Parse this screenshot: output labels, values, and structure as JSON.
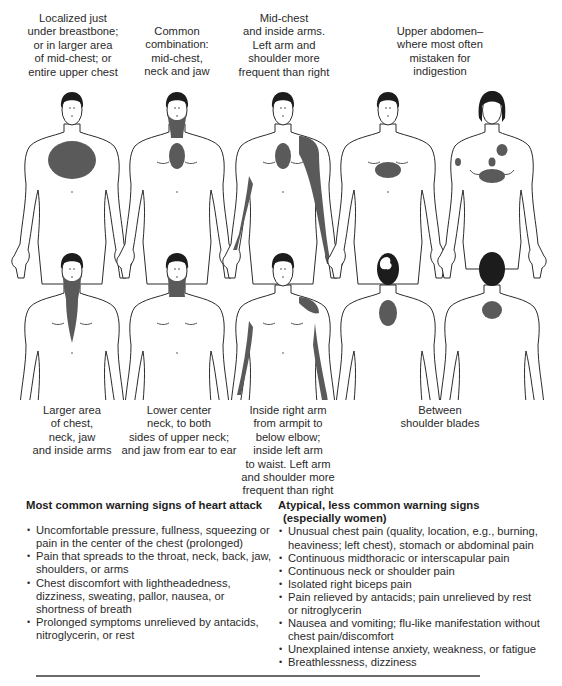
{
  "figure": {
    "top_row": [
      {
        "id": "fig1",
        "caption": "Localized just\nunder breastbone;\nor in larger area\nof mid-chest; or\nentire upper chest",
        "view": "front",
        "sex": "male",
        "cx": 72,
        "areas": [
          "upper-chest-large"
        ]
      },
      {
        "id": "fig2",
        "caption": "Common\ncombination:\nmid-chest,\nneck and jaw",
        "view": "front",
        "sex": "male",
        "cx": 177,
        "areas": [
          "jaw-neck",
          "mid-chest"
        ]
      },
      {
        "id": "fig3",
        "caption": "Mid-chest\nand inside arms.\nLeft arm and\nshoulder more\nfrequent than right",
        "view": "front",
        "sex": "male",
        "cx": 283,
        "areas": [
          "mid-chest",
          "left-shoulder-arm",
          "right-inner-arm"
        ]
      },
      {
        "id": "fig4",
        "caption": "Upper abdomen–\nwhere most often\nmistaken for\nindigestion",
        "view": "front",
        "sex": "male",
        "cx": 388,
        "areas": [
          "upper-abdomen"
        ]
      },
      {
        "id": "fig5",
        "caption": "",
        "view": "front",
        "sex": "female",
        "cx": 492,
        "areas": [
          "upper-abdomen",
          "left-chest-spot",
          "mid-spot",
          "right-arm-spot"
        ]
      }
    ],
    "bottom_row": [
      {
        "id": "fig6",
        "caption": "Larger area\nof chest,\nneck, jaw\nand inside arms",
        "view": "front",
        "sex": "male",
        "cx": 72,
        "areas": [
          "jaw-neck-chest-tie"
        ]
      },
      {
        "id": "fig7",
        "caption": "Lower center\nneck, to both\nsides of upper neck;\nand jaw from ear to ear",
        "view": "front",
        "sex": "male",
        "cx": 177,
        "areas": [
          "jaw-neck"
        ]
      },
      {
        "id": "fig8",
        "caption": "Inside right arm\nfrom armpit to\nbelow elbow;\ninside left arm\nto waist. Left arm\nand shoulder more\nfrequent than right",
        "view": "front",
        "sex": "male",
        "cx": 283,
        "areas": [
          "left-shoulder-cap",
          "left-inner-arm-long",
          "right-inner-arm"
        ]
      },
      {
        "id": "fig9",
        "caption": "Between\nshoulder blades",
        "view": "back",
        "sex": "male",
        "cx": 388,
        "areas": [
          "between-shoulder-blades"
        ]
      },
      {
        "id": "fig10",
        "caption": "",
        "view": "back",
        "sex": "female",
        "cx": 492,
        "areas": [
          "between-shoulder-blades-round"
        ]
      }
    ],
    "colors": {
      "pain": "#5a5a5a",
      "outline": "#2b2b2b",
      "hair": "#1c1c1c"
    }
  },
  "sections": {
    "common": {
      "title": "Most common warning signs of heart attack",
      "items": [
        "Uncomfortable pressure, fullness, squeezing or pain in the center of the chest (prolonged)",
        "Pain that spreads to the throat, neck, back, jaw, shoulders, or arms",
        "Chest discomfort with lightheadedness, dizziness, sweating, pallor, nausea, or shortness of breath",
        "Prolonged symptoms unrelieved by antacids, nitroglycerin, or rest"
      ]
    },
    "atypical": {
      "title": "Atypical, less common warning signs",
      "subtitle": "(especially women)",
      "items": [
        "Unusual chest pain (quality, location, e.g., burning, heaviness; left chest), stomach or abdominal pain",
        "Continuous midthoracic or interscapular pain",
        "Continuous neck or shoulder pain",
        "Isolated right biceps pain",
        "Pain relieved by antacids; pain unrelieved by rest or nitroglycerin",
        "Nausea and vomiting; flu-like manifestation without chest pain/discomfort",
        "Unexplained intense anxiety, weakness, or fatigue",
        "Breathlessness, dizziness"
      ]
    }
  }
}
